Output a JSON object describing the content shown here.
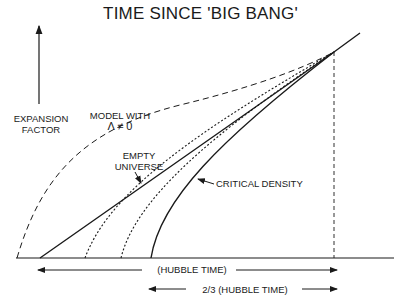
{
  "title": "TIME SINCE 'BIG BANG'",
  "labels": {
    "yaxis_line1": "EXPANSION",
    "yaxis_line2": "FACTOR",
    "lambda_line1": "MODEL WITH",
    "lambda_line2": "Λ ≠ 0",
    "empty_line1": "EMPTY",
    "empty_line2": "UNIVERSE",
    "critical": "CRITICAL DENSITY",
    "hubble_time": "(HUBBLE TIME)",
    "two_thirds_hubble": "2/3 (HUBBLE TIME)"
  },
  "curves": [
    {
      "name": "model-with-lambda",
      "style": "dashed",
      "start_x": 17
    },
    {
      "name": "empty-universe",
      "style": "solid",
      "start_x": 40
    },
    {
      "name": "intermediate-1",
      "style": "dotted",
      "start_x": 85
    },
    {
      "name": "intermediate-2",
      "style": "dotted",
      "start_x": 121
    },
    {
      "name": "critical-density",
      "style": "solid",
      "start_x": 151
    }
  ],
  "colors": {
    "ink": "#1a1a1a",
    "background": "#ffffff"
  }
}
